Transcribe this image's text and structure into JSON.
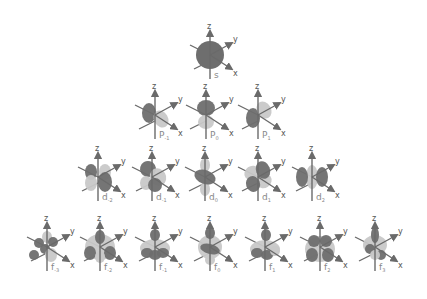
{
  "colors": {
    "lobe_dark": "#6e6e6e",
    "lobe_light": "#c8c8c8",
    "axis": "#6a6a6a",
    "label": "#888888",
    "background": "#ffffff"
  },
  "axes": {
    "z": "z",
    "y": "y",
    "x": "x"
  },
  "rows": [
    {
      "name": "s-row",
      "orbitals": [
        {
          "id": "s",
          "base": "s",
          "sub": "",
          "cx": 210,
          "cy": 55,
          "shape": "s"
        }
      ]
    },
    {
      "name": "p-row",
      "orbitals": [
        {
          "id": "p-1",
          "base": "P",
          "sub": "-1",
          "cx": 155,
          "cy": 115,
          "shape": "p-1"
        },
        {
          "id": "p0",
          "base": "P",
          "sub": "0",
          "cx": 206,
          "cy": 115,
          "shape": "p0"
        },
        {
          "id": "p1",
          "base": "P",
          "sub": "1",
          "cx": 258,
          "cy": 115,
          "shape": "p1"
        }
      ]
    },
    {
      "name": "d-row",
      "orbitals": [
        {
          "id": "d-2",
          "base": "d",
          "sub": "-2",
          "cx": 98,
          "cy": 177,
          "shape": "d-2"
        },
        {
          "id": "d-1",
          "base": "d",
          "sub": "-1",
          "cx": 152,
          "cy": 177,
          "shape": "d-1"
        },
        {
          "id": "d0",
          "base": "d",
          "sub": "0",
          "cx": 205,
          "cy": 177,
          "shape": "d0"
        },
        {
          "id": "d1",
          "base": "d",
          "sub": "1",
          "cx": 258,
          "cy": 177,
          "shape": "d1"
        },
        {
          "id": "d2",
          "base": "d",
          "sub": "2",
          "cx": 312,
          "cy": 177,
          "shape": "d2"
        }
      ]
    },
    {
      "name": "f-row",
      "orbitals": [
        {
          "id": "f-3",
          "base": "f",
          "sub": "-3",
          "cx": 47,
          "cy": 247,
          "shape": "f-3"
        },
        {
          "id": "f-2",
          "base": "f",
          "sub": "-2",
          "cx": 100,
          "cy": 247,
          "shape": "f-2"
        },
        {
          "id": "f-1",
          "base": "f",
          "sub": "-1",
          "cx": 155,
          "cy": 247,
          "shape": "f-1"
        },
        {
          "id": "f0",
          "base": "f",
          "sub": "0",
          "cx": 210,
          "cy": 247,
          "shape": "f0"
        },
        {
          "id": "f1",
          "base": "f",
          "sub": "1",
          "cx": 265,
          "cy": 247,
          "shape": "f1"
        },
        {
          "id": "f2",
          "base": "f",
          "sub": "2",
          "cx": 320,
          "cy": 247,
          "shape": "f2"
        },
        {
          "id": "f3",
          "base": "f",
          "sub": "3",
          "cx": 375,
          "cy": 247,
          "shape": "f3"
        }
      ]
    }
  ]
}
